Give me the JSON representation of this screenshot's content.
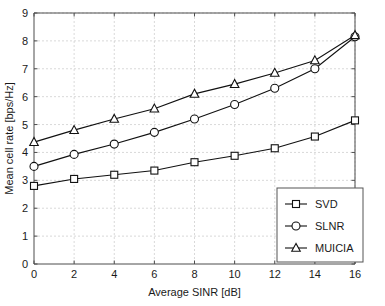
{
  "chart_data": {
    "type": "line",
    "title": "",
    "xlabel": "Average SINR [dB]",
    "ylabel": "Mean cell rate [bps/Hz]",
    "x": [
      0,
      2,
      4,
      6,
      8,
      10,
      12,
      14,
      16
    ],
    "xlim": [
      0,
      16
    ],
    "ylim": [
      0,
      9
    ],
    "xticks": [
      0,
      2,
      4,
      6,
      8,
      10,
      12,
      14,
      16
    ],
    "yticks": [
      0,
      1,
      2,
      3,
      4,
      5,
      6,
      7,
      8,
      9
    ],
    "xtick_labels": [
      "0",
      "2",
      "4",
      "6",
      "8",
      "10",
      "12",
      "14",
      "16"
    ],
    "ytick_labels": [
      "0",
      "1",
      "2",
      "3",
      "4",
      "5",
      "6",
      "7",
      "8",
      "9"
    ],
    "grid": true,
    "legend_position": "lower right",
    "series": [
      {
        "name": "SVD",
        "marker": "square",
        "values": [
          2.8,
          3.05,
          3.2,
          3.35,
          3.65,
          3.88,
          4.15,
          4.57,
          5.15
        ]
      },
      {
        "name": "SLNR",
        "marker": "circle",
        "values": [
          3.5,
          3.93,
          4.3,
          4.72,
          5.2,
          5.72,
          6.3,
          7.0,
          8.15
        ]
      },
      {
        "name": "MUICIA",
        "marker": "triangle",
        "values": [
          4.37,
          4.8,
          5.2,
          5.57,
          6.1,
          6.45,
          6.85,
          7.3,
          8.2
        ]
      }
    ],
    "colors": {
      "line": "#111111",
      "grid": "#c8c8c8",
      "axis": "#4d4d4d",
      "background": "#ffffff",
      "text": "#1a1a1a"
    }
  }
}
